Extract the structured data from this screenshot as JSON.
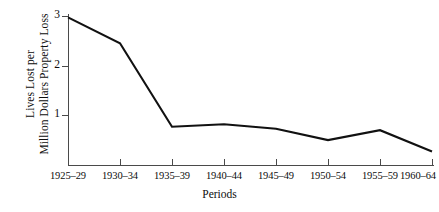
{
  "chart_data": {
    "type": "line",
    "title": "",
    "xlabel": "Periods",
    "ylabel": "Lives Lost per Million Dollars Property Loss",
    "ylabel_lines": [
      "Lives Lost per",
      "Million Dollars Property Loss"
    ],
    "categories": [
      "1925–29",
      "1930–34",
      "1935–39",
      "1940–44",
      "1945–49",
      "1950–54",
      "1955–59",
      "1960–64"
    ],
    "values": [
      2.97,
      2.45,
      0.77,
      0.82,
      0.73,
      0.5,
      0.7,
      0.27
    ],
    "series": [
      {
        "name": "Lives lost per million dollars property loss",
        "values": [
          2.97,
          2.45,
          0.77,
          0.82,
          0.73,
          0.5,
          0.7,
          0.27
        ]
      }
    ],
    "ylim": [
      0,
      3.1
    ],
    "yticks": [
      1,
      2,
      3
    ],
    "ytick_labels": [
      "1",
      "2",
      "3"
    ],
    "grid": false,
    "legend": false,
    "legend_position": "none",
    "line_color": "#111111",
    "background_color": "#ffffff",
    "axis_color": "#4a4a4a"
  },
  "axes": {
    "y_ticks": [
      {
        "label": "3",
        "value": 3
      },
      {
        "label": "2",
        "value": 2
      },
      {
        "label": "1",
        "value": 1
      }
    ],
    "x_ticks": [
      {
        "label": "1925–29"
      },
      {
        "label": "1930–34"
      },
      {
        "label": "1935–39"
      },
      {
        "label": "1940–44"
      },
      {
        "label": "1945–49"
      },
      {
        "label": "1950–54"
      },
      {
        "label": "1955–59"
      },
      {
        "label": "1960–64"
      }
    ]
  }
}
